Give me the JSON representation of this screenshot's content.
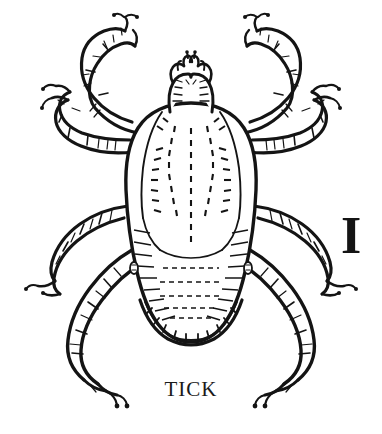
{
  "image": {
    "kind": "line-engraving",
    "subject": "tick",
    "view": "dorsal",
    "background_color": "#ffffff",
    "ink_color": "#111111"
  },
  "caption": {
    "label": "TICK"
  },
  "scale_marker": {
    "label": "I"
  },
  "anatomy": {
    "capitulum_label": "capitulum",
    "palps_label": "palps",
    "scutum_label": "scutum",
    "idiosoma_label": "idiosoma",
    "festoons_label": "festoons",
    "leg_count": 8,
    "legs": [
      "left-leg-1",
      "left-leg-2",
      "left-leg-3",
      "left-leg-4",
      "right-leg-1",
      "right-leg-2",
      "right-leg-3",
      "right-leg-4"
    ]
  }
}
